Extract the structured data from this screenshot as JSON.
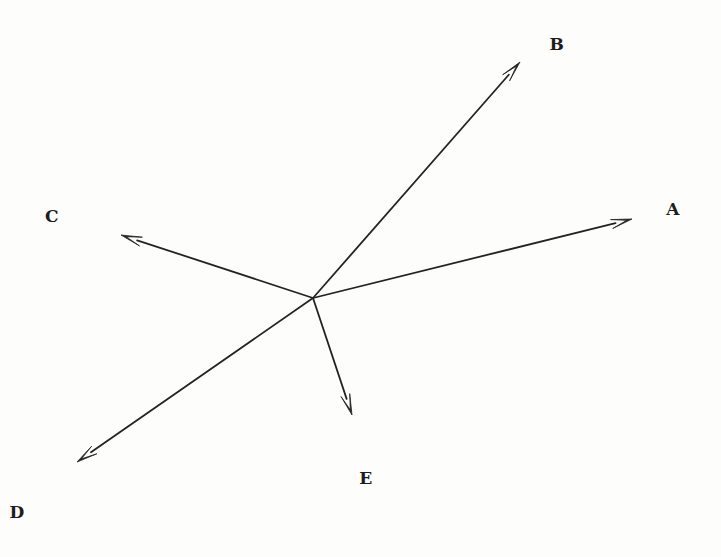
{
  "figure": {
    "type": "vector-diagram",
    "width": 721,
    "height": 557,
    "background_color": "#fdfdfb",
    "stroke_color": "#232323",
    "label_color": "#1c1c1c",
    "stroke_width": 1.8,
    "origin": {
      "x": 313,
      "y": 298
    }
  },
  "vectors": [
    {
      "label": "A",
      "from": {
        "x": 313,
        "y": 298
      },
      "to": {
        "x": 632,
        "y": 219
      },
      "label_pos": {
        "x": 673,
        "y": 209
      },
      "arrowhead": true
    },
    {
      "label": "B",
      "from": {
        "x": 313,
        "y": 298
      },
      "to": {
        "x": 520,
        "y": 62
      },
      "label_pos": {
        "x": 557,
        "y": 44
      },
      "arrowhead": true
    },
    {
      "label": "C",
      "from": {
        "x": 313,
        "y": 298
      },
      "to": {
        "x": 121,
        "y": 235
      },
      "label_pos": {
        "x": 52,
        "y": 216
      },
      "arrowhead": true
    },
    {
      "label": "D",
      "from": {
        "x": 313,
        "y": 298
      },
      "to": {
        "x": 77,
        "y": 462
      },
      "label_pos": {
        "x": 17,
        "y": 512
      },
      "arrowhead": true
    },
    {
      "label": "E",
      "from": {
        "x": 313,
        "y": 298
      },
      "to": {
        "x": 352,
        "y": 415
      },
      "label_pos": {
        "x": 366,
        "y": 478
      },
      "arrowhead": true
    }
  ]
}
